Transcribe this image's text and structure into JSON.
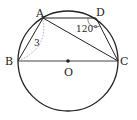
{
  "diagram": {
    "type": "geometry-circle-inscribed-quadrilateral",
    "points": {
      "A": {
        "label": "A"
      },
      "B": {
        "label": "B"
      },
      "C": {
        "label": "C"
      },
      "D": {
        "label": "D"
      },
      "O": {
        "label": "O"
      }
    },
    "annotations": {
      "side_AB": "3",
      "angle_D": "120°"
    },
    "colors": {
      "stroke": "#222222",
      "dashed": "#999999",
      "background": "#ffffff"
    }
  }
}
